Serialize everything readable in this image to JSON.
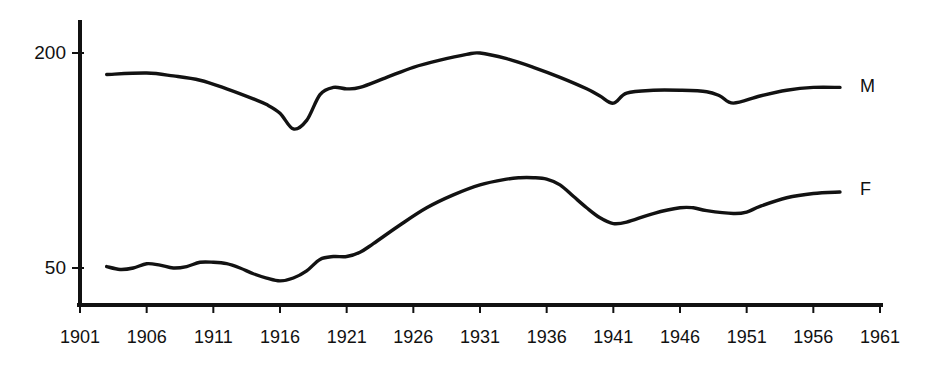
{
  "chart_data": {
    "type": "line",
    "title": "",
    "subtitle": "",
    "xlabel": "",
    "ylabel": "",
    "xlim": [
      1901,
      1961
    ],
    "ylim": [
      0,
      215
    ],
    "grid": false,
    "legend_position": "right-of-line-ends",
    "x_tick_labels": [
      "1901",
      "1906",
      "1911",
      "1916",
      "1921",
      "1926",
      "1931",
      "1936",
      "1941",
      "1946",
      "1951",
      "1956",
      "1961"
    ],
    "x_tick_values": [
      1901,
      1906,
      1911,
      1916,
      1921,
      1926,
      1931,
      1936,
      1941,
      1946,
      1951,
      1956,
      1961
    ],
    "y_tick_labels": [
      "200",
      "50"
    ],
    "y_tick_values": [
      200,
      50
    ],
    "series": [
      {
        "name": "M",
        "label": "M",
        "color": "#121212",
        "x": [
          1903,
          1906,
          1908,
          1910,
          1912,
          1914,
          1915,
          1916,
          1917,
          1918,
          1919,
          1920,
          1921,
          1922,
          1924,
          1926,
          1928,
          1930,
          1931,
          1933,
          1935,
          1937,
          1939,
          1940,
          1941,
          1942,
          1944,
          1946,
          1948,
          1949,
          1950,
          1952,
          1954,
          1956,
          1958
        ],
        "y": [
          185,
          186,
          184,
          181,
          175,
          168,
          164,
          158,
          147,
          153,
          171,
          176,
          175,
          176,
          183,
          190,
          195,
          199,
          200,
          196,
          190,
          183,
          175,
          170,
          165,
          172,
          174,
          174,
          173,
          170,
          165,
          170,
          174,
          176,
          176
        ],
        "label_at": {
          "x": 1959.5,
          "y": 176
        }
      },
      {
        "name": "F",
        "label": "F",
        "color": "#121212",
        "x": [
          1903,
          1904,
          1905,
          1906,
          1907,
          1908,
          1909,
          1910,
          1911,
          1912,
          1913,
          1914,
          1915,
          1916,
          1917,
          1918,
          1919,
          1920,
          1921,
          1922,
          1923,
          1925,
          1927,
          1929,
          1931,
          1933,
          1934,
          1935,
          1936,
          1937,
          1938,
          1939,
          1940,
          1941,
          1942,
          1944,
          1946,
          1947,
          1948,
          1950,
          1951,
          1952,
          1954,
          1956,
          1958
        ],
        "y": [
          51,
          49,
          50,
          53,
          52,
          50,
          51,
          54,
          54,
          53,
          50,
          46,
          43,
          41,
          43,
          48,
          56,
          58,
          58,
          61,
          67,
          80,
          92,
          101,
          108,
          112,
          113,
          113,
          112,
          108,
          100,
          92,
          85,
          81,
          82,
          88,
          92,
          92,
          90,
          88,
          89,
          93,
          99,
          102,
          103
        ],
        "label_at": {
          "x": 1959.5,
          "y": 104
        }
      }
    ],
    "annotations": []
  },
  "axes": {
    "y_axis_name": "y-axis",
    "x_axis_name": "x-axis"
  }
}
